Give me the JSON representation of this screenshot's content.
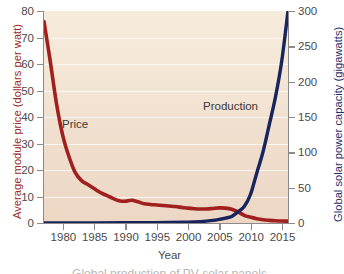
{
  "chart_data": {
    "type": "line",
    "title": "",
    "xlabel": "Year",
    "xlim": [
      1977,
      2016
    ],
    "xticks": [
      1980,
      1985,
      1990,
      1995,
      2000,
      2005,
      2010,
      2015
    ],
    "grid": true,
    "legend_position": "inline-annotation",
    "axes": [
      {
        "id": "left",
        "label": "Average module price (dollars per watt)",
        "color": "#9b2b24",
        "ylim": [
          0,
          80
        ],
        "yticks": [
          0,
          10,
          20,
          30,
          40,
          50,
          60,
          70,
          80
        ]
      },
      {
        "id": "right",
        "label": "Global solar power capacity (gigawatts)",
        "color": "#1d2f6b",
        "ylim": [
          0,
          300
        ],
        "yticks": [
          0,
          50,
          100,
          150,
          200,
          250,
          300
        ]
      }
    ],
    "series": [
      {
        "name": "Price",
        "axis": "left",
        "color": "#a01f1f",
        "annotation": "Price",
        "unit": "dollars per watt",
        "x": [
          1977,
          1978,
          1979,
          1980,
          1981,
          1982,
          1983,
          1984,
          1985,
          1986,
          1987,
          1988,
          1989,
          1990,
          1991,
          1992,
          1993,
          1994,
          1995,
          1996,
          1997,
          1998,
          1999,
          2000,
          2001,
          2002,
          2003,
          2004,
          2005,
          2006,
          2007,
          2008,
          2009,
          2010,
          2011,
          2012,
          2013,
          2014,
          2015,
          2016
        ],
        "values": [
          76,
          61,
          45,
          33,
          25,
          19,
          16,
          14.5,
          13,
          11.5,
          10.4,
          9.3,
          8.4,
          8.2,
          8.6,
          8.0,
          7.3,
          7.0,
          6.8,
          6.6,
          6.4,
          6.2,
          5.9,
          5.6,
          5.4,
          5.3,
          5.3,
          5.5,
          5.7,
          5.6,
          5.2,
          4.2,
          2.9,
          2.2,
          1.6,
          1.2,
          1.0,
          0.85,
          0.75,
          0.7
        ]
      },
      {
        "name": "Production",
        "axis": "right",
        "color": "#17245e",
        "annotation": "Production",
        "unit": "gigawatts",
        "x": [
          1977,
          1980,
          1985,
          1990,
          1995,
          2000,
          2002,
          2004,
          2005,
          2006,
          2007,
          2008,
          2009,
          2010,
          2011,
          2012,
          2013,
          2014,
          2015,
          2016
        ],
        "values": [
          0,
          0.1,
          0.2,
          0.3,
          0.6,
          1.3,
          2.0,
          3.7,
          5.1,
          6.9,
          9.2,
          15.8,
          23.2,
          40.3,
          70.5,
          100.5,
          138.9,
          178.4,
          229.3,
          300
        ]
      }
    ]
  },
  "chart": {
    "yticks_left": [
      "0",
      "10",
      "20",
      "30",
      "40",
      "50",
      "60",
      "70",
      "80"
    ],
    "yticks_right": [
      "0",
      "50",
      "100",
      "150",
      "200",
      "250",
      "300"
    ],
    "xticks": [
      "1980",
      "1985",
      "1990",
      "1995",
      "2000",
      "2005",
      "2010",
      "2015"
    ],
    "ytitle_left": "Average module price (dollars per watt)",
    "ytitle_right": "Global solar power capacity (gigawatts)",
    "xtitle": "Year",
    "label_price": "Price",
    "label_production": "Production",
    "caption": "Global production of PV solar panels",
    "colors": {
      "price_line": "#a01f1f",
      "production_line": "#17245e",
      "plot_background": "#f2e4d2",
      "gridline": "#ffffff",
      "axis": "#8d8b88",
      "tick_text": "#4c4a47"
    }
  }
}
